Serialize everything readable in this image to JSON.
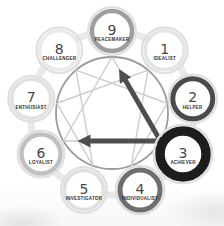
{
  "diagram": {
    "name": "enneagram",
    "orbit_band_color": "#e9e9e9",
    "halo_color": "#dfdfdf",
    "central_circle_color": "#9b9b9b",
    "figure_line_color": "#cdcdcd",
    "arrow_color": "#4e4e4e",
    "number_color": "#474747",
    "label_color": "#2e2e2e",
    "circle_fill": "#ffffff",
    "types": [
      {
        "number": "9",
        "label": "PEACEMAKER",
        "angle": 0,
        "ring_color": "#9e9e9e",
        "ring_width": 4.5,
        "radius": 20
      },
      {
        "number": "1",
        "label": "IDEALIST",
        "angle": 40,
        "ring_color": "#e4e4e4",
        "ring_width": 3.5,
        "radius": 19.5
      },
      {
        "number": "2",
        "label": "HELPER",
        "angle": 80,
        "ring_color": "#4b4b4b",
        "ring_width": 5,
        "radius": 20
      },
      {
        "number": "3",
        "label": "ACHIEVER",
        "angle": 120,
        "ring_color": "#1d1d1d",
        "ring_width": 9.5,
        "radius": 23
      },
      {
        "number": "4",
        "label": "INDIVIDUALIST",
        "angle": 160,
        "ring_color": "#6e6e6e",
        "ring_width": 5,
        "radius": 20
      },
      {
        "number": "5",
        "label": "INVESTIGATOR",
        "angle": 200,
        "ring_color": "#dfdfdf",
        "ring_width": 3.5,
        "radius": 19.5
      },
      {
        "number": "6",
        "label": "LOYALIST",
        "angle": 240,
        "ring_color": "#c0c0c0",
        "ring_width": 4.5,
        "radius": 19.5
      },
      {
        "number": "7",
        "label": "ENTHUSIAST",
        "angle": 280,
        "ring_color": "#e1e1e1",
        "ring_width": 3.5,
        "radius": 19.5
      },
      {
        "number": "8",
        "label": "CHALLENGER",
        "angle": 320,
        "ring_color": "#ebebeb",
        "ring_width": 3.5,
        "radius": 19.5
      }
    ],
    "hexad_sequence": [
      "1",
      "4",
      "2",
      "8",
      "5",
      "7",
      "1"
    ],
    "triangle_sequence": [
      "9",
      "3",
      "6",
      "9"
    ],
    "arrows": [
      {
        "from": "3",
        "to": "9"
      },
      {
        "from": "3",
        "to": "6"
      }
    ]
  }
}
